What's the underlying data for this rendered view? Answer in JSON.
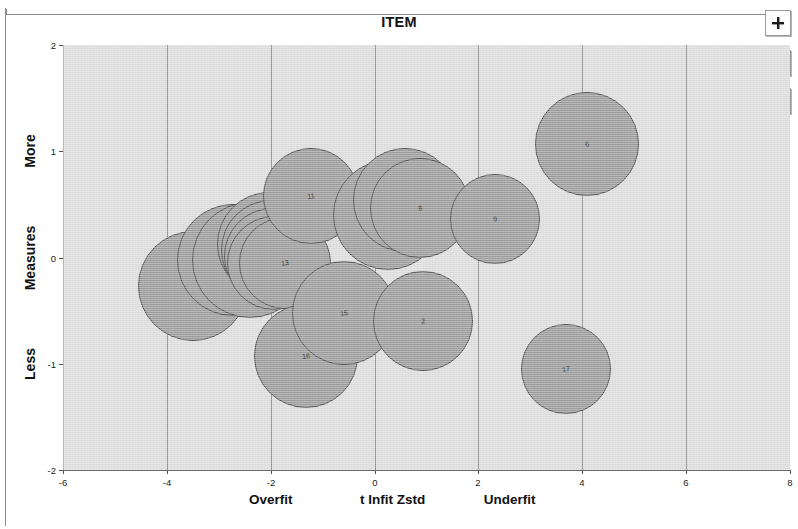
{
  "window": {
    "title": "ITEM"
  },
  "toolbar": {
    "buttons": [
      {
        "name": "add-button",
        "icon": "plus-icon",
        "label": "+"
      },
      {
        "name": "brush-button",
        "icon": "brush-icon",
        "label": "Brush"
      },
      {
        "name": "filter-button",
        "icon": "funnel-icon",
        "label": "Filter"
      }
    ]
  },
  "colors": {
    "plot_background": "#dddddd",
    "bubble_fill": "#9d9d9d",
    "bubble_stroke": "#4a4a4a",
    "gridline": "#8a8a8a",
    "axis": "#6a6a6a",
    "text": "#111111"
  },
  "chart_data": {
    "type": "scatter",
    "title": "ITEM",
    "xlabel": "t Infit Zstd",
    "ylabel": "Measures",
    "xlim": [
      -6,
      8
    ],
    "ylim": [
      -2,
      2
    ],
    "xticks": [
      -6,
      -4,
      -2,
      0,
      2,
      4,
      6,
      8
    ],
    "xtick_labels": [
      "-6",
      "-4",
      "-2",
      "0",
      "2",
      "4",
      "6",
      "8"
    ],
    "yticks": [
      -2,
      -1,
      0,
      1,
      2
    ],
    "ytick_labels": [
      "-2",
      "-1",
      "0",
      "1",
      "2"
    ],
    "gridlines_x": [
      -4,
      -2,
      0,
      2,
      4,
      6
    ],
    "grid": true,
    "legend": "none",
    "x_axis_segments": [
      {
        "label": "Overfit",
        "at": -2.0
      },
      {
        "label": "t Infit Zstd",
        "at": 0.35
      },
      {
        "label": "Underfit",
        "at": 2.6
      }
    ],
    "y_axis_segments": [
      {
        "label": "More",
        "at": 1.0
      },
      {
        "label": "Measures",
        "at": 0.0
      },
      {
        "label": "Less",
        "at": -1.0
      }
    ],
    "marker": "bubble",
    "points": [
      {
        "label": "4",
        "x": -3.5,
        "y": -0.27,
        "r": 55
      },
      {
        "label": "10",
        "x": -2.72,
        "y": -0.02,
        "r": 56
      },
      {
        "label": "16",
        "x": -2.4,
        "y": -0.02,
        "r": 58
      },
      {
        "label": "3",
        "x": -2.03,
        "y": 0.13,
        "r": 52
      },
      {
        "label": "7",
        "x": -2.0,
        "y": 0.07,
        "r": 50
      },
      {
        "label": "5",
        "x": -1.98,
        "y": 0.01,
        "r": 48
      },
      {
        "label": "14",
        "x": -1.93,
        "y": -0.05,
        "r": 47
      },
      {
        "label": "13",
        "x": -1.73,
        "y": -0.05,
        "r": 46
      },
      {
        "label": "11",
        "x": -1.23,
        "y": 0.58,
        "r": 48
      },
      {
        "label": "18",
        "x": -1.32,
        "y": -0.93,
        "r": 52
      },
      {
        "label": "15",
        "x": -0.58,
        "y": -0.52,
        "r": 52
      },
      {
        "label": "1",
        "x": 0.26,
        "y": 0.4,
        "r": 55
      },
      {
        "label": "12",
        "x": 0.58,
        "y": 0.54,
        "r": 52
      },
      {
        "label": "8",
        "x": 0.88,
        "y": 0.47,
        "r": 50
      },
      {
        "label": "2",
        "x": 0.93,
        "y": -0.6,
        "r": 50
      },
      {
        "label": "9",
        "x": 2.32,
        "y": 0.36,
        "r": 45
      },
      {
        "label": "6",
        "x": 4.1,
        "y": 1.07,
        "r": 52
      },
      {
        "label": "17",
        "x": 3.68,
        "y": -1.05,
        "r": 45
      }
    ]
  }
}
